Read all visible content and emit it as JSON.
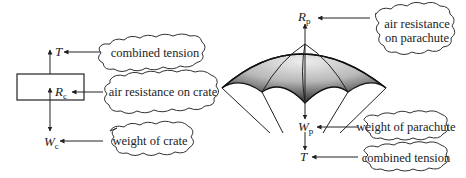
{
  "diagram": {
    "crate": {
      "forces": [
        {
          "id": "T",
          "symbol": "T",
          "subscript": "",
          "label": "combined tension"
        },
        {
          "id": "Rc",
          "symbol": "R",
          "subscript": "c",
          "label": "air resistance on crate"
        },
        {
          "id": "Wc",
          "symbol": "W",
          "subscript": "c",
          "label": "weight of crate"
        }
      ]
    },
    "parachute": {
      "forces": [
        {
          "id": "Rp",
          "symbol": "R",
          "subscript": "p",
          "label_line1": "air resistance",
          "label_line2": "on parachute"
        },
        {
          "id": "Wp",
          "symbol": "W",
          "subscript": "p",
          "label": "weight of parachute"
        },
        {
          "id": "T",
          "symbol": "T",
          "subscript": "",
          "label": "combined tension"
        }
      ]
    },
    "colors": {
      "line": "#222222",
      "canopy_dark": "#555555",
      "canopy_light": "#e6e6e6",
      "background": "#ffffff"
    }
  }
}
